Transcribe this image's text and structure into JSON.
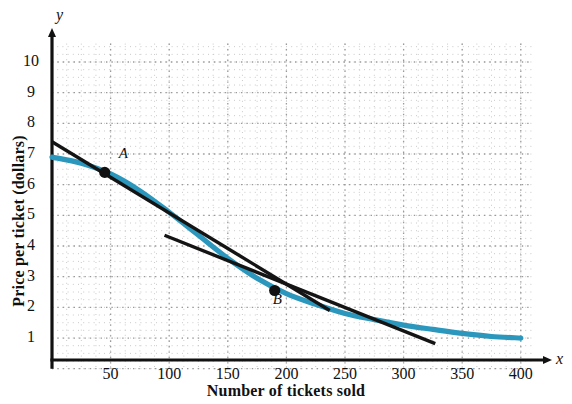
{
  "chart_data": {
    "type": "line",
    "title": "",
    "xlabel": "Number of tickets sold",
    "ylabel": "Price per ticket (dollars)",
    "x_axis_variable": "x",
    "y_axis_variable": "y",
    "xlim": [
      0,
      410
    ],
    "ylim": [
      0,
      10.6
    ],
    "xticks": [
      50,
      100,
      150,
      200,
      250,
      300,
      350,
      400
    ],
    "yticks": [
      1,
      2,
      3,
      4,
      5,
      6,
      7,
      8,
      9,
      10
    ],
    "grid": true,
    "grid_style": "dotted",
    "legend": "none",
    "series": [
      {
        "name": "demand-curve",
        "type": "curve",
        "color": "#2b97bd",
        "points": [
          [
            0,
            6.9
          ],
          [
            25,
            6.7
          ],
          [
            50,
            6.35
          ],
          [
            75,
            5.8
          ],
          [
            100,
            5.1
          ],
          [
            125,
            4.35
          ],
          [
            150,
            3.6
          ],
          [
            175,
            2.95
          ],
          [
            200,
            2.45
          ],
          [
            225,
            2.1
          ],
          [
            250,
            1.8
          ],
          [
            275,
            1.6
          ],
          [
            300,
            1.42
          ],
          [
            325,
            1.28
          ],
          [
            350,
            1.15
          ],
          [
            375,
            1.05
          ],
          [
            400,
            1.0
          ]
        ]
      },
      {
        "name": "tangent-line-at-A",
        "type": "line",
        "color": "#141414",
        "points": [
          [
            0,
            7.4
          ],
          [
            237,
            1.9
          ]
        ]
      },
      {
        "name": "tangent-line-at-B",
        "type": "line",
        "color": "#141414",
        "points": [
          [
            96,
            4.35
          ],
          [
            327,
            0.82
          ]
        ]
      }
    ],
    "annotations": [
      {
        "label": "A",
        "x": 45,
        "y": 6.4,
        "marker": "filled-circle",
        "label_dx": 14,
        "label_dy": -16
      },
      {
        "label": "B",
        "x": 190,
        "y": 2.55,
        "marker": "filled-circle",
        "label_dx": -2,
        "label_dy": 12
      }
    ]
  },
  "colors": {
    "curve": "#2b97bd",
    "tangent": "#141414",
    "axis": "#111111",
    "grid_major": "#9a9a9a",
    "grid_minor": "#c9c9c9",
    "marker": "#111111"
  },
  "axis_labels": {
    "y_ticks": [
      "10",
      "9",
      "8",
      "7",
      "6",
      "5",
      "4",
      "3",
      "2",
      "1"
    ],
    "x_ticks": [
      "50",
      "100",
      "150",
      "200",
      "250",
      "300",
      "350",
      "400"
    ]
  }
}
